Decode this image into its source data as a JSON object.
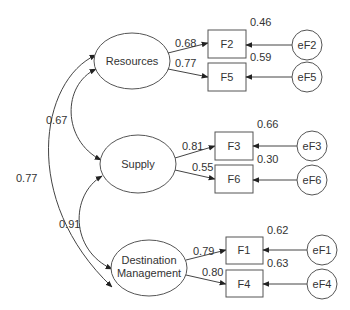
{
  "diagram": {
    "type": "structural-equation-model",
    "latent": [
      {
        "id": "resources",
        "label": "Resources",
        "cx": 132,
        "cy": 61
      },
      {
        "id": "supply",
        "label": "Supply",
        "cx": 138,
        "cy": 164
      },
      {
        "id": "dm",
        "label_line1": "Destination",
        "label_line2": "Management",
        "cx": 149,
        "cy": 268
      }
    ],
    "observed": [
      {
        "id": "F2",
        "label": "F2",
        "loading": "0.68",
        "r2": "0.46",
        "error": "eF2"
      },
      {
        "id": "F5",
        "label": "F5",
        "loading": "0.77",
        "r2": "0.59",
        "error": "eF5"
      },
      {
        "id": "F3",
        "label": "F3",
        "loading": "0.81",
        "r2": "0.66",
        "error": "eF3"
      },
      {
        "id": "F6",
        "label": "F6",
        "loading": "0.55",
        "r2": "0.30",
        "error": "eF6"
      },
      {
        "id": "F1",
        "label": "F1",
        "loading": "0.79",
        "r2": "0.62",
        "error": "eF1"
      },
      {
        "id": "F4",
        "label": "F4",
        "loading": "0.80",
        "r2": "0.63",
        "error": "eF4"
      }
    ],
    "covariances": [
      {
        "from": "Resources",
        "to": "Supply",
        "value": "0.67"
      },
      {
        "from": "Supply",
        "to": "Destination Management",
        "value": "0.91"
      },
      {
        "from": "Resources",
        "to": "Destination Management",
        "value": "0.77"
      }
    ],
    "colors": {
      "stroke": "#555555",
      "text": "#333333",
      "background": "#ffffff"
    }
  }
}
